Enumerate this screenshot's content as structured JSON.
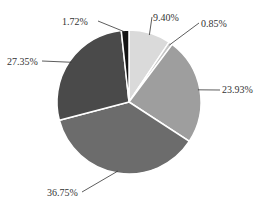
{
  "chart_data": {
    "type": "pie",
    "title": "",
    "categories": [
      "Slice 1",
      "Slice 2",
      "Slice 3",
      "Slice 4",
      "Slice 5",
      "Slice 6"
    ],
    "values": [
      9.4,
      0.85,
      23.93,
      36.75,
      27.35,
      1.72
    ],
    "labels": [
      "9.40%",
      "0.85%",
      "23.93%",
      "36.75%",
      "27.35%",
      "1.72%"
    ],
    "colors": [
      "#dadada",
      "#c4c4c4",
      "#9e9e9e",
      "#6c6c6c",
      "#4a4a4a",
      "#151515"
    ],
    "start_angle_deg": 0,
    "direction": "clockwise",
    "legend": "none"
  }
}
